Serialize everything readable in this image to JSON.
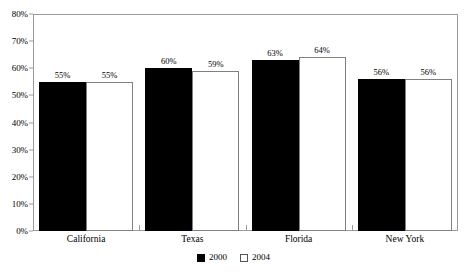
{
  "chart_data": {
    "type": "bar",
    "title": "",
    "subtitle": "",
    "xlabel": "",
    "ylabel": "",
    "categories": [
      "California",
      "Texas",
      "Florida",
      "New York"
    ],
    "series": [
      {
        "name": "2000",
        "color": "#000000",
        "values": [
          55,
          60,
          63,
          56
        ],
        "value_labels": [
          "55%",
          "60%",
          "63%",
          "56%"
        ]
      },
      {
        "name": "2004",
        "color": "#ffffff",
        "values": [
          55,
          59,
          64,
          56
        ],
        "value_labels": [
          "55%",
          "59%",
          "64%",
          "56%"
        ]
      }
    ],
    "ylim": [
      0,
      80
    ],
    "ytick_values": [
      0,
      10,
      20,
      30,
      40,
      50,
      60,
      70,
      80
    ],
    "ytick_labels": [
      "0%",
      "10%",
      "20%",
      "30%",
      "40%",
      "50%",
      "60%",
      "70%",
      "80%"
    ],
    "grid": false,
    "legend_position": "bottom-center",
    "axis_color": "#9a9a9a",
    "data_label_format": "percent"
  },
  "legend": {
    "items": [
      {
        "label": "2000",
        "swatch": "filled-black-square"
      },
      {
        "label": "2004",
        "swatch": "open-white-square"
      }
    ]
  }
}
